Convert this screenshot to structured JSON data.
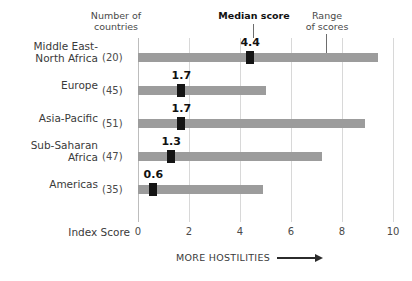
{
  "headers": {
    "countries": "Number of\ncountries",
    "median": "Median score",
    "range": "Range\nof scores"
  },
  "axis_title": "Index Score",
  "footer_note": "MORE HOSTILITIES",
  "colors": {
    "bar": "#9c9c9c",
    "marker": "#141414",
    "gridline": "#d8d8d8",
    "text": "#3a3a3a"
  },
  "chart_data": {
    "type": "bar",
    "title": "",
    "subtitle": "",
    "xlabel": "Index Score",
    "ylabel": "",
    "xlim": [
      0,
      10
    ],
    "xticks": [
      0,
      2,
      4,
      6,
      8,
      10
    ],
    "xtick_labels": [
      "0",
      "2",
      "4",
      "6",
      "8",
      "10"
    ],
    "grid": true,
    "legend": "annotations",
    "annotations": [
      "Median score",
      "Range of scores",
      "MORE HOSTILITIES"
    ],
    "categories": [
      "Middle East-North Africa",
      "Europe",
      "Asia-Pacific",
      "Sub-Saharan Africa",
      "Americas"
    ],
    "rows": [
      {
        "label": "Middle East-\nNorth Africa",
        "count": "(20)",
        "median": 4.4,
        "median_label": "4.4",
        "range_min": 0.0,
        "range_max": 9.4
      },
      {
        "label": "Europe",
        "count": "(45)",
        "median": 1.7,
        "median_label": "1.7",
        "range_min": 0.0,
        "range_max": 5.0
      },
      {
        "label": "Asia-Pacific",
        "count": "(51)",
        "median": 1.7,
        "median_label": "1.7",
        "range_min": 0.0,
        "range_max": 8.9
      },
      {
        "label": "Sub-Saharan\nAfrica",
        "count": "(47)",
        "median": 1.3,
        "median_label": "1.3",
        "range_min": 0.0,
        "range_max": 7.2
      },
      {
        "label": "Americas",
        "count": "(35)",
        "median": 0.6,
        "median_label": "0.6",
        "range_min": 0.0,
        "range_max": 4.9
      }
    ]
  }
}
